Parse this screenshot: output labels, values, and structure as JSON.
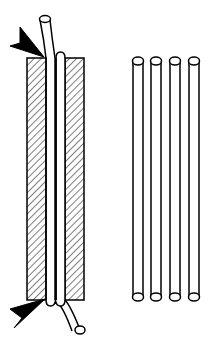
{
  "diagram": {
    "colors": {
      "stroke": "#000000",
      "fill": "#ffffff",
      "arrow": "#000000",
      "hatch": "#000000"
    },
    "clamp_assembly": {
      "blocks": [
        {
          "name": "left-block",
          "x": 27,
          "y": 58,
          "w": 19,
          "h": 242
        },
        {
          "name": "right-block",
          "x": 65,
          "y": 58,
          "w": 19,
          "h": 242
        }
      ],
      "tube_count_in_clamp": 2,
      "arrows": [
        {
          "name": "top-arrow",
          "position": "top-left"
        },
        {
          "name": "bottom-arrow",
          "position": "bottom-left"
        }
      ]
    },
    "loose_tubes": {
      "count": 4,
      "x_positions": [
        138,
        156,
        175,
        194
      ],
      "top_y": 60,
      "bottom_y": 297
    }
  }
}
